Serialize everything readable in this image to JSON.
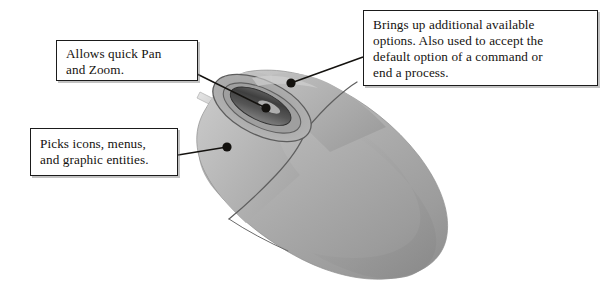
{
  "figure": {
    "colors": {
      "box_border": "#1b1b1b",
      "box_fill": "#ffffff",
      "text": "#15120f",
      "leader_line": "#14120f",
      "leader_dot": "#14120f",
      "mouse_body_light": "#c2c2c2",
      "mouse_body_mid": "#a8a8a8",
      "mouse_body_dark": "#9a9a9a",
      "mouse_body_shadow": "#8d8d8d",
      "wheel_dark": "#4a4a4a",
      "wheel_recess": "#7e7e7e",
      "seam_line": "#5d5d5d",
      "cord": "#d9d9d9"
    }
  },
  "callouts": [
    {
      "id": "pan-zoom",
      "text": "Allows quick Pan\nand Zoom.",
      "target": "scroll-wheel"
    },
    {
      "id": "picks",
      "text": "Picks icons, menus,\nand graphic entities.",
      "target": "left-button"
    },
    {
      "id": "options",
      "text": "Brings up additional available\noptions. Also used to accept the\ndefault option of a command or\nend a process.",
      "target": "right-button"
    }
  ],
  "leaders": [
    {
      "id": "leader-pan-zoom",
      "from_x": 197,
      "from_y": 74,
      "to_x": 266,
      "to_y": 108
    },
    {
      "id": "leader-picks",
      "from_x": 178,
      "from_y": 155,
      "to_x": 227,
      "to_y": 147
    },
    {
      "id": "leader-options",
      "from_x": 363,
      "from_y": 57,
      "to_x": 291,
      "to_y": 83
    }
  ]
}
